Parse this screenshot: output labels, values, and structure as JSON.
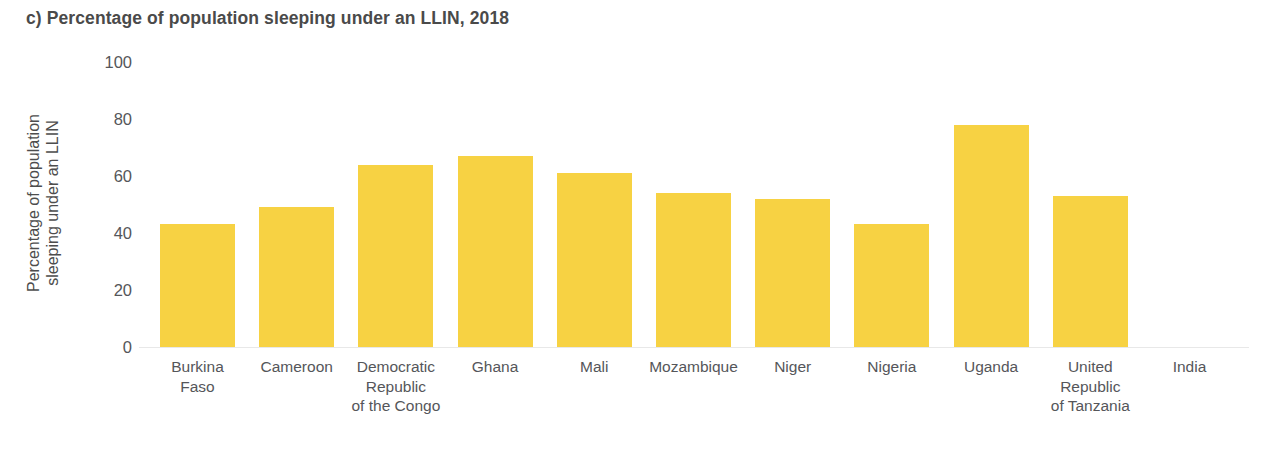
{
  "chart_data": {
    "type": "bar",
    "title": "c) Percentage of population sleeping under an LLIN, 2018",
    "xlabel": "",
    "ylabel": "Percentage of population\nsleeping under an LLIN",
    "ylim": [
      0,
      100
    ],
    "yticks": [
      100,
      80,
      60,
      40,
      20,
      0
    ],
    "ytick_labels": [
      "100",
      "80",
      "60",
      "40",
      "20",
      "0"
    ],
    "grid": false,
    "legend": "none",
    "bar_color": "#f7d243",
    "categories": [
      "Burkina\nFaso",
      "Cameroon",
      "Democratic\nRepublic\nof the Congo",
      "Ghana",
      "Mali",
      "Mozambique",
      "Niger",
      "Nigeria",
      "Uganda",
      "United\nRepublic\nof Tanzania",
      "India"
    ],
    "values": [
      43,
      49,
      64,
      67,
      61,
      54,
      52,
      43,
      78,
      53,
      0
    ]
  },
  "colors": {
    "bar": "#f7d243",
    "title_text": "#4a4a4a",
    "axis_text": "#55565a",
    "baseline": "#e8e8e8",
    "background": "#ffffff"
  }
}
